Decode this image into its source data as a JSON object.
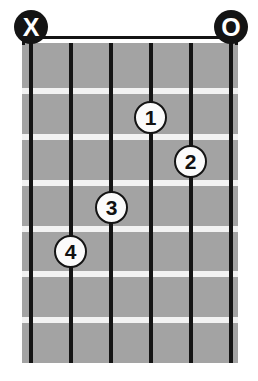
{
  "diagram": {
    "type": "guitar-chord-diagram",
    "width": 258,
    "height": 381,
    "strings_count": 6,
    "frets_count": 7,
    "background_color": "#ffffff",
    "fretboard_color": "#a3a3a3",
    "string_color": "#141414",
    "fret_color": "#f2f2f2",
    "marker_color": "#141414",
    "dot_fill_color": "#fbfbfb",
    "dot_text_color": "#111111"
  },
  "fretboard": {
    "left": 22,
    "top": 42,
    "width": 216,
    "height": 321
  },
  "strings": [
    {
      "index": 1,
      "x": 31
    },
    {
      "index": 2,
      "x": 71
    },
    {
      "index": 3,
      "x": 111
    },
    {
      "index": 4,
      "x": 151
    },
    {
      "index": 5,
      "x": 191
    },
    {
      "index": 6,
      "x": 231
    }
  ],
  "frets": [
    {
      "index": 1,
      "y": 88
    },
    {
      "index": 2,
      "y": 134
    },
    {
      "index": 3,
      "y": 180
    },
    {
      "index": 4,
      "y": 226
    },
    {
      "index": 5,
      "y": 271
    },
    {
      "index": 6,
      "y": 317
    }
  ],
  "open_mute_markers": [
    {
      "label": "X",
      "name": "mute-marker",
      "string": 1,
      "x": 14,
      "y": 10
    },
    {
      "label": "O",
      "name": "open-marker",
      "string": 6,
      "x": 214,
      "y": 10
    }
  ],
  "finger_dots": [
    {
      "label": "1",
      "string": 4,
      "fret": 2,
      "cx": 151,
      "cy": 118
    },
    {
      "label": "2",
      "string": 5,
      "fret": 3,
      "cx": 191,
      "cy": 162
    },
    {
      "label": "3",
      "string": 3,
      "fret": 4,
      "cx": 112,
      "cy": 208
    },
    {
      "label": "4",
      "string": 2,
      "fret": 5,
      "cx": 71,
      "cy": 252
    }
  ]
}
